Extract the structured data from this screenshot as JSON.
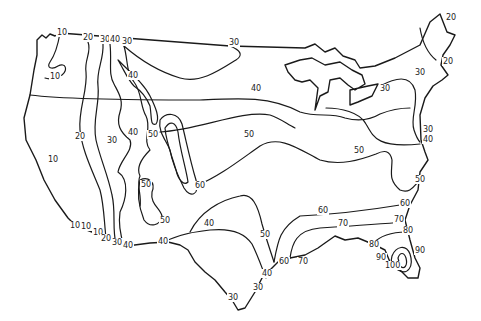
{
  "map": {
    "subject": "Contiguous United States contour map",
    "stroke_color": "#1a1a1a",
    "background": "#ffffff",
    "contour_values": [
      10,
      20,
      30,
      40,
      50,
      60,
      70,
      80,
      90,
      100
    ],
    "labels": [
      {
        "id": "l1",
        "text": "10",
        "x": 57,
        "y": 35
      },
      {
        "id": "l2",
        "text": "20",
        "x": 83,
        "y": 40
      },
      {
        "id": "l3",
        "text": "30",
        "x": 100,
        "y": 42
      },
      {
        "id": "l4",
        "text": "40",
        "x": 110,
        "y": 42
      },
      {
        "id": "l5",
        "text": "30",
        "x": 122,
        "y": 44
      },
      {
        "id": "l6",
        "text": "30",
        "x": 229,
        "y": 45
      },
      {
        "id": "l7",
        "text": "10",
        "x": 50,
        "y": 79
      },
      {
        "id": "l8",
        "text": "40",
        "x": 128,
        "y": 78
      },
      {
        "id": "l9",
        "text": "20",
        "x": 75,
        "y": 139
      },
      {
        "id": "l10",
        "text": "30",
        "x": 107,
        "y": 143
      },
      {
        "id": "l11",
        "text": "40",
        "x": 128,
        "y": 135
      },
      {
        "id": "l12",
        "text": "50",
        "x": 148,
        "y": 137
      },
      {
        "id": "l13",
        "text": "10",
        "x": 48,
        "y": 162
      },
      {
        "id": "l14",
        "text": "50",
        "x": 141,
        "y": 187
      },
      {
        "id": "l15",
        "text": "60",
        "x": 195,
        "y": 188
      },
      {
        "id": "l16",
        "text": "50",
        "x": 160,
        "y": 223
      },
      {
        "id": "l17",
        "text": "40",
        "x": 204,
        "y": 226
      },
      {
        "id": "l18",
        "text": "40",
        "x": 251,
        "y": 91
      },
      {
        "id": "l19",
        "text": "50",
        "x": 244,
        "y": 137
      },
      {
        "id": "l20",
        "text": "50",
        "x": 354,
        "y": 153
      },
      {
        "id": "l21",
        "text": "10",
        "x": 70,
        "y": 228
      },
      {
        "id": "l22",
        "text": "10",
        "x": 81,
        "y": 229
      },
      {
        "id": "l23",
        "text": "10",
        "x": 93,
        "y": 235
      },
      {
        "id": "l24",
        "text": "20",
        "x": 101,
        "y": 241
      },
      {
        "id": "l25",
        "text": "30",
        "x": 112,
        "y": 245
      },
      {
        "id": "l26",
        "text": "40",
        "x": 123,
        "y": 248
      },
      {
        "id": "l27",
        "text": "40",
        "x": 158,
        "y": 244
      },
      {
        "id": "l28",
        "text": "50",
        "x": 260,
        "y": 237
      },
      {
        "id": "l29",
        "text": "40",
        "x": 262,
        "y": 276
      },
      {
        "id": "l30",
        "text": "30",
        "x": 253,
        "y": 290
      },
      {
        "id": "l31",
        "text": "30",
        "x": 228,
        "y": 300
      },
      {
        "id": "l32",
        "text": "60",
        "x": 279,
        "y": 264
      },
      {
        "id": "l33",
        "text": "70",
        "x": 298,
        "y": 264
      },
      {
        "id": "l34",
        "text": "60",
        "x": 318,
        "y": 213
      },
      {
        "id": "l35",
        "text": "70",
        "x": 338,
        "y": 226
      },
      {
        "id": "l36",
        "text": "60",
        "x": 400,
        "y": 206
      },
      {
        "id": "l37",
        "text": "70",
        "x": 394,
        "y": 222
      },
      {
        "id": "l38",
        "text": "80",
        "x": 403,
        "y": 233
      },
      {
        "id": "l39",
        "text": "80",
        "x": 369,
        "y": 247
      },
      {
        "id": "l40",
        "text": "90",
        "x": 376,
        "y": 260
      },
      {
        "id": "l41",
        "text": "100",
        "x": 385,
        "y": 268
      },
      {
        "id": "l42",
        "text": "90",
        "x": 415,
        "y": 253
      },
      {
        "id": "l43",
        "text": "20",
        "x": 446,
        "y": 20
      },
      {
        "id": "l44",
        "text": "20",
        "x": 443,
        "y": 64
      },
      {
        "id": "l45",
        "text": "30",
        "x": 415,
        "y": 75
      },
      {
        "id": "l46",
        "text": "30",
        "x": 380,
        "y": 91
      },
      {
        "id": "l47",
        "text": "30",
        "x": 423,
        "y": 132
      },
      {
        "id": "l48",
        "text": "40",
        "x": 423,
        "y": 142
      },
      {
        "id": "l49",
        "text": "50",
        "x": 415,
        "y": 182
      }
    ]
  }
}
